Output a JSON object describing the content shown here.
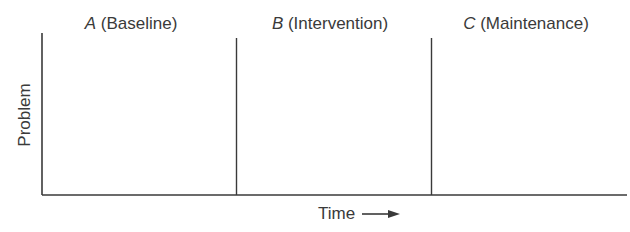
{
  "diagram": {
    "type": "single-case ABC design",
    "y_axis_label": "Problem",
    "x_axis_label": "Time",
    "x_axis_arrow": "right-arrow",
    "phases": [
      {
        "letter": "A",
        "name": "(Baseline)"
      },
      {
        "letter": "B",
        "name": "(Intervention)"
      },
      {
        "letter": "C",
        "name": "(Maintenance)"
      }
    ],
    "colors": {
      "line": "#3a3a3a",
      "text": "#3a3a3a",
      "background": "#ffffff"
    }
  }
}
